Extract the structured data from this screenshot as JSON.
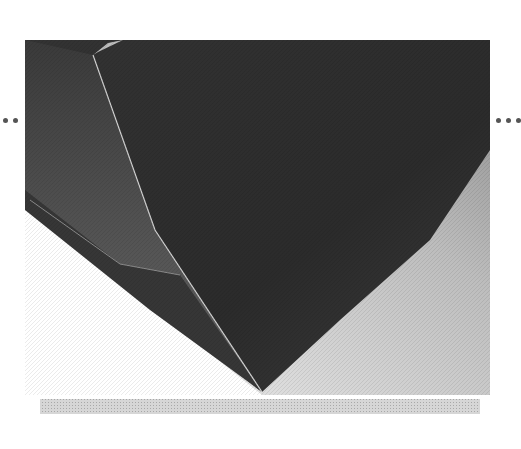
{
  "image": {
    "subject": "folded dark paper corner",
    "colors": {
      "background": "#ffffff",
      "paper_dark": "#2e2e2e",
      "paper_mid": "#4a4a4a",
      "flap_light": "#5c5c5c",
      "fold_edge": "#d8d8d8",
      "highlight_bg": "#e6e6e6",
      "shadow_strip": "#c4c4c4"
    }
  },
  "navigation": {
    "prev_label": "••",
    "next_label": "•••"
  }
}
